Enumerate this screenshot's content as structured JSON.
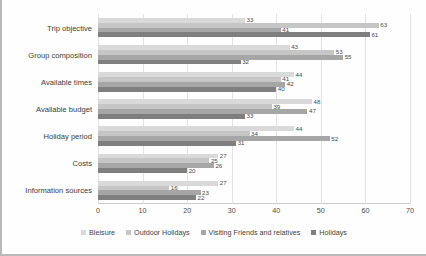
{
  "chart_data": {
    "type": "bar",
    "orientation": "horizontal",
    "title": "",
    "xlabel": "",
    "ylabel": "",
    "xlim": [
      0,
      70
    ],
    "xticks": [
      0,
      10,
      20,
      30,
      40,
      50,
      60,
      70
    ],
    "grid": true,
    "legend_position": "bottom",
    "categories": [
      "Trip objective",
      "Group composition",
      "Available times",
      "Available budget",
      "Holiday period",
      "Costs",
      "Information sources"
    ],
    "series": [
      {
        "name": "Bleisure",
        "color": "#d9d9d9",
        "values": [
          33,
          43,
          44,
          48,
          44,
          27,
          27
        ]
      },
      {
        "name": "Outdoor Holidays",
        "color": "#c6c6c6",
        "values": [
          63,
          53,
          41,
          39,
          34,
          25,
          16
        ]
      },
      {
        "name": "Visiting Friends and relatives",
        "color": "#a6a6a6",
        "values": [
          41,
          55,
          42,
          47,
          52,
          26,
          23
        ]
      },
      {
        "name": "Holidays",
        "color": "#7f7f7f",
        "values": [
          61,
          32,
          40,
          33,
          31,
          20,
          22
        ]
      }
    ]
  },
  "axis": {
    "tick_labels": [
      "0",
      "10",
      "20",
      "30",
      "40",
      "50",
      "60",
      "70"
    ]
  },
  "legend": {
    "items": [
      {
        "label": "Bleisure",
        "color": "#d9d9d9"
      },
      {
        "label": "Outdoor Holidays",
        "color": "#c6c6c6"
      },
      {
        "label": "Visiting Friends and relatives",
        "color": "#a6a6a6"
      },
      {
        "label": "Holidays",
        "color": "#7f7f7f"
      }
    ]
  }
}
